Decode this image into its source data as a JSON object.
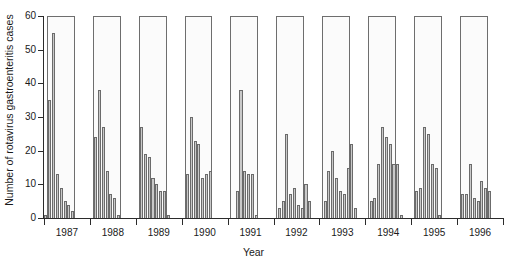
{
  "chart_data": {
    "type": "bar",
    "title": "",
    "subtitle": "",
    "xlabel": "Year",
    "ylabel": "Number of rotavirus gastroenteritis cases",
    "ylim": [
      0,
      60
    ],
    "yticks": [
      0,
      10,
      20,
      30,
      40,
      50,
      60
    ],
    "ytick_labels": [
      "0",
      "10",
      "20",
      "30",
      "40",
      "50",
      "60"
    ],
    "grid": false,
    "legend": null,
    "xtick_labels": [
      "1987",
      "1988",
      "1989",
      "1990",
      "1991",
      "1992",
      "1993",
      "1994",
      "1995",
      "1996"
    ],
    "x_axis_note": "Monthly counts plotted continuously; tall open rectangles mark the winter epidemic season of each year",
    "bar_color": "#c9c9c9",
    "bar_edge_color": "#6b6b6b",
    "season_box_edge_color": "#6e6e6e",
    "axis_color": "#2b2b2b",
    "series": [
      {
        "name": "Monthly rotavirus gastroenteritis cases",
        "categories": [
          "1987-01",
          "1987-02",
          "1987-03",
          "1987-04",
          "1987-05",
          "1987-06",
          "1987-07",
          "1987-08",
          "1987-09",
          "1987-10",
          "1987-11",
          "1987-12",
          "1988-01",
          "1988-02",
          "1988-03",
          "1988-04",
          "1988-05",
          "1988-06",
          "1988-07",
          "1988-08",
          "1988-09",
          "1988-10",
          "1988-11",
          "1988-12",
          "1989-01",
          "1989-02",
          "1989-03",
          "1989-04",
          "1989-05",
          "1989-06",
          "1989-07",
          "1989-08",
          "1989-09",
          "1989-10",
          "1989-11",
          "1989-12",
          "1990-01",
          "1990-02",
          "1990-03",
          "1990-04",
          "1990-05",
          "1990-06",
          "1990-07",
          "1990-08",
          "1990-09",
          "1990-10",
          "1990-11",
          "1990-12",
          "1991-01",
          "1991-02",
          "1991-03",
          "1991-04",
          "1991-05",
          "1991-06",
          "1991-07",
          "1991-08",
          "1991-09",
          "1991-10",
          "1991-11",
          "1991-12",
          "1992-01",
          "1992-02",
          "1992-03",
          "1992-04",
          "1992-05",
          "1992-06",
          "1992-07",
          "1992-08",
          "1992-09",
          "1992-10",
          "1992-11",
          "1992-12",
          "1993-01",
          "1993-02",
          "1993-03",
          "1993-04",
          "1993-05",
          "1993-06",
          "1993-07",
          "1993-08",
          "1993-09",
          "1993-10",
          "1993-11",
          "1993-12",
          "1994-01",
          "1994-02",
          "1994-03",
          "1994-04",
          "1994-05",
          "1994-06",
          "1994-07",
          "1994-08",
          "1994-09",
          "1994-10",
          "1994-11",
          "1994-12",
          "1995-01",
          "1995-02",
          "1995-03",
          "1995-04",
          "1995-05",
          "1995-06",
          "1995-07",
          "1995-08",
          "1995-09",
          "1995-10",
          "1995-11",
          "1995-12",
          "1996-01",
          "1996-02",
          "1996-03",
          "1996-04",
          "1996-05",
          "1996-06",
          "1996-07",
          "1996-08",
          "1996-09",
          "1996-10",
          "1996-11",
          "1996-12"
        ],
        "values": [
          1,
          35,
          55,
          13,
          9,
          5,
          4,
          2,
          0,
          0,
          0,
          0,
          0,
          24,
          38,
          27,
          14,
          7,
          6,
          1,
          0,
          0,
          0,
          0,
          0,
          27,
          19,
          18,
          12,
          10,
          8,
          8,
          1,
          0,
          0,
          0,
          0,
          13,
          30,
          23,
          22,
          12,
          13,
          14,
          0,
          0,
          0,
          0,
          0,
          0,
          8,
          38,
          14,
          13,
          13,
          1,
          0,
          0,
          0,
          0,
          0,
          3,
          5,
          25,
          7,
          9,
          4,
          3,
          10,
          5,
          0,
          0,
          0,
          5,
          14,
          20,
          12,
          8,
          7,
          15,
          22,
          3,
          0,
          0,
          0,
          5,
          6,
          16,
          27,
          24,
          22,
          16,
          16,
          1,
          0,
          0,
          0,
          8,
          9,
          27,
          25,
          16,
          15,
          1,
          0,
          0,
          0,
          0,
          0,
          7,
          7,
          16,
          6,
          5,
          11,
          9,
          8,
          0,
          0,
          0
        ]
      }
    ],
    "season_boxes": [
      {
        "year": "1987",
        "height": 60
      },
      {
        "year": "1988",
        "height": 60
      },
      {
        "year": "1989",
        "height": 60
      },
      {
        "year": "1990",
        "height": 60
      },
      {
        "year": "1991",
        "height": 60
      },
      {
        "year": "1992",
        "height": 60
      },
      {
        "year": "1993",
        "height": 60
      },
      {
        "year": "1994",
        "height": 60
      },
      {
        "year": "1995",
        "height": 60
      },
      {
        "year": "1996",
        "height": 60
      }
    ]
  }
}
